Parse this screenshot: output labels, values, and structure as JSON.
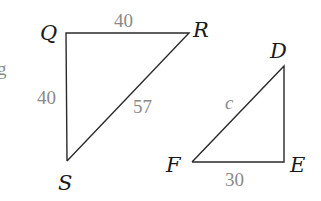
{
  "figure": {
    "cropped_left_text": "g",
    "triangles": [
      {
        "name": "QRS",
        "vertices": {
          "Q": {
            "label": "Q",
            "x": 66,
            "y": 33
          },
          "R": {
            "label": "R",
            "x": 189,
            "y": 33
          },
          "S": {
            "label": "S",
            "x": 67,
            "y": 161
          }
        },
        "sides": {
          "QR": "40",
          "QS": "40",
          "RS": "57"
        }
      },
      {
        "name": "DEF",
        "vertices": {
          "D": {
            "label": "D",
            "x": 284,
            "y": 66
          },
          "E": {
            "label": "E",
            "x": 284,
            "y": 162
          },
          "F": {
            "label": "F",
            "x": 192,
            "y": 162
          }
        },
        "sides": {
          "DF": "c",
          "FE": "30"
        }
      }
    ]
  },
  "colors": {
    "line": "#2a2a2a",
    "vertex_label": "#1a1a1a",
    "side_label": "#8a8a8a"
  }
}
